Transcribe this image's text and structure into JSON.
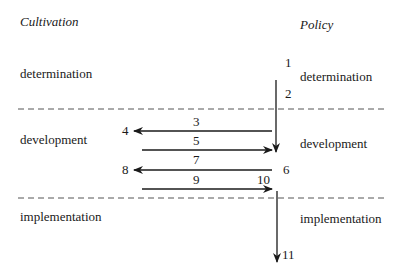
{
  "columns": {
    "left_title": "Cultivation",
    "right_title": "Policy"
  },
  "left_stages": {
    "determination": "determination",
    "development": "development",
    "implementation": "implementation"
  },
  "right_stages": {
    "determination": "determination",
    "development": "development",
    "implementation": "implementation"
  },
  "step_numbers": {
    "n1": "1",
    "n2": "2",
    "n3": "3",
    "n4": "4",
    "n5": "5",
    "n6": "6",
    "n7": "7",
    "n8": "8",
    "n9": "9",
    "n10": "10",
    "n11": "11"
  },
  "colors": {
    "stroke": "#1a1a1a",
    "dash": "#555555"
  }
}
